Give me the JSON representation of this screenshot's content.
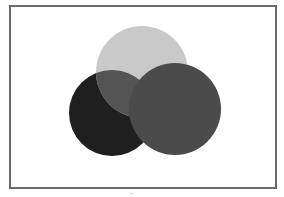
{
  "diagram": {
    "type": "overlapping-circles",
    "frame": {
      "stroke": "#6b6b6b",
      "fill": "#ffffff"
    },
    "circles": [
      {
        "name": "left-circle",
        "cx": 112,
        "cy": 113,
        "r": 43,
        "fill": "#1f1f1f"
      },
      {
        "name": "top-circle",
        "cx": 142,
        "cy": 72,
        "r": 46,
        "fill": "#c9c9c9"
      },
      {
        "name": "right-circle",
        "cx": 175,
        "cy": 109,
        "r": 46,
        "fill": "#4b4b4b"
      }
    ],
    "overlap_top_left": {
      "fill": "#545454"
    }
  }
}
